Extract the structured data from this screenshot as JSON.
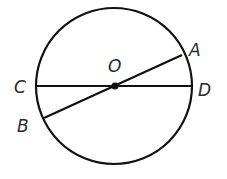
{
  "diagram": {
    "title": "",
    "circle": {
      "cx": 114,
      "cy": 86,
      "r": 78,
      "stroke": "#111111"
    },
    "center": {
      "label": "O",
      "x": 114,
      "y": 86
    },
    "points": [
      {
        "label": "A",
        "x": 182,
        "y": 55,
        "label_x": 189,
        "label_y": 56
      },
      {
        "label": "B",
        "x": 44,
        "y": 118,
        "label_x": 17,
        "label_y": 132
      },
      {
        "label": "C",
        "x": 36,
        "y": 86,
        "label_x": 14,
        "label_y": 93
      },
      {
        "label": "D",
        "x": 192,
        "y": 86,
        "label_x": 198,
        "label_y": 96
      }
    ],
    "segments": [
      {
        "name": "diameter-CD",
        "from": "C",
        "to": "D"
      },
      {
        "name": "diameter-AB",
        "from": "A",
        "to": "B"
      }
    ],
    "labels": {
      "O": "O",
      "A": "A",
      "B": "B",
      "C": "C",
      "D": "D"
    }
  }
}
